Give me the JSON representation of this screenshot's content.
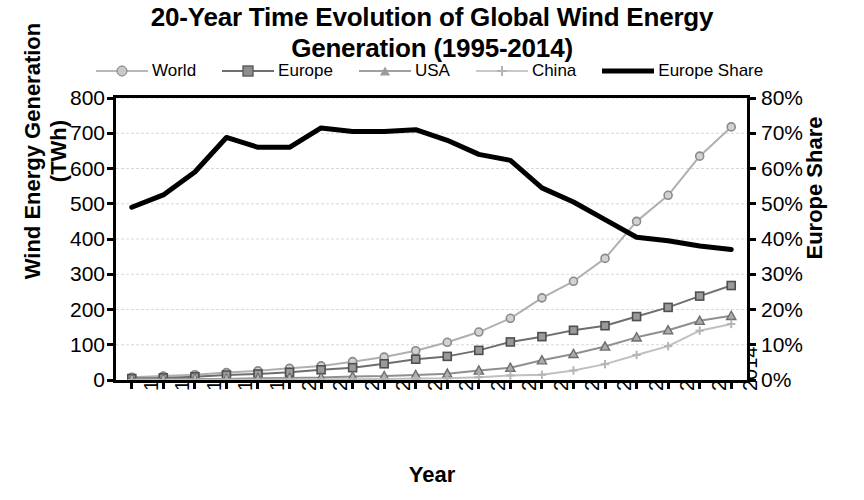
{
  "chart_data": {
    "type": "line",
    "title": "20-Year Time Evolution of Global Wind Energy Generation (1995-2014)",
    "title_line1": "20-Year Time Evolution of Global Wind Energy",
    "title_line2": "Generation (1995-2014)",
    "xlabel": "Year",
    "ylabel": "Wind Energy Generation (TWh)",
    "ylabel_secondary": "Europe Share",
    "ylim": [
      0,
      800
    ],
    "ylim_secondary": [
      0,
      80
    ],
    "yticks": [
      0,
      100,
      200,
      300,
      400,
      500,
      600,
      700,
      800
    ],
    "yticklabels": [
      "0",
      "100",
      "200",
      "300",
      "400",
      "500",
      "600",
      "700",
      "800"
    ],
    "yticks_secondary": [
      0,
      10,
      20,
      30,
      40,
      50,
      60,
      70,
      80
    ],
    "yticklabels_secondary": [
      "0%",
      "10%",
      "20%",
      "30%",
      "40%",
      "50%",
      "60%",
      "70%",
      "80%"
    ],
    "grid": true,
    "grid_axis": "y",
    "legend_position": "top",
    "categories": [
      "1995",
      "1996",
      "1997",
      "1998",
      "1999",
      "2000",
      "2001",
      "2002",
      "2003",
      "2004",
      "2005",
      "2006",
      "2007",
      "2008",
      "2009",
      "2010",
      "2011",
      "2012",
      "2013",
      "2014"
    ],
    "series": [
      {
        "name": "World",
        "axis": "left",
        "unit": "TWh",
        "marker": "circle",
        "color": "#b0b0b0",
        "values": [
          8,
          11,
          15,
          21,
          26,
          33,
          40,
          52,
          65,
          83,
          107,
          136,
          175,
          233,
          280,
          345,
          450,
          524,
          635,
          718
        ]
      },
      {
        "name": "Europe",
        "axis": "left",
        "unit": "TWh",
        "marker": "square",
        "color": "#6e6e6e",
        "values": [
          4,
          6,
          9,
          14,
          17,
          22,
          29,
          35,
          46,
          59,
          67,
          84,
          108,
          123,
          141,
          154,
          180,
          206,
          238,
          268
        ]
      },
      {
        "name": "USA",
        "axis": "left",
        "unit": "TWh",
        "marker": "triangle",
        "color": "#8f8f8f",
        "values": [
          3,
          3,
          3,
          3,
          5,
          6,
          7,
          10,
          11,
          14,
          18,
          27,
          35,
          56,
          74,
          95,
          121,
          141,
          168,
          182
        ]
      },
      {
        "name": "China",
        "axis": "left",
        "unit": "TWh",
        "marker": "cross",
        "color": "#c0c0c0",
        "values": [
          0,
          0,
          1,
          1,
          1,
          2,
          2,
          2,
          3,
          4,
          5,
          8,
          13,
          15,
          27,
          45,
          71,
          96,
          140,
          159
        ]
      },
      {
        "name": "Europe Share",
        "axis": "right",
        "unit": "%",
        "marker": "none",
        "color": "#000000",
        "line_width": 5,
        "values": [
          49.0,
          52.5,
          59.0,
          68.8,
          66.0,
          66.0,
          71.5,
          70.5,
          70.5,
          71.0,
          68.0,
          64.0,
          62.3,
          54.5,
          50.5,
          45.5,
          40.5,
          39.5,
          38.0,
          37.0
        ]
      }
    ]
  },
  "legend": {
    "items": [
      {
        "label": "World",
        "marker": "circle"
      },
      {
        "label": "Europe",
        "marker": "square"
      },
      {
        "label": "USA",
        "marker": "triangle"
      },
      {
        "label": "China",
        "marker": "cross"
      },
      {
        "label": "Europe Share",
        "marker": "line"
      }
    ]
  }
}
